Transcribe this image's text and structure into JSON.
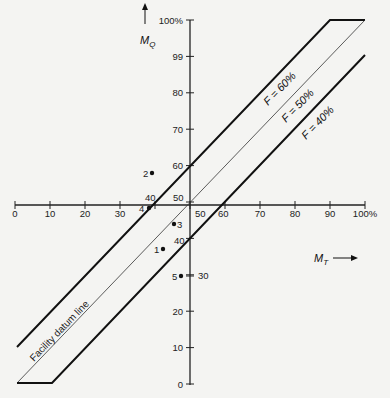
{
  "chart_data": {
    "type": "line",
    "title": "",
    "xlabel": "M_T",
    "ylabel": "M_Q",
    "x_ticks": [
      "0",
      "10",
      "20",
      "30",
      "40",
      "50",
      "60",
      "70",
      "80",
      "90",
      "100%"
    ],
    "y_ticks": [
      "0",
      "10",
      "20",
      "30",
      "40",
      "50",
      "60",
      "70",
      "80",
      "99",
      "100%"
    ],
    "xlim": [
      0,
      100
    ],
    "ylim": [
      0,
      100
    ],
    "grid": false,
    "axis_crossing": {
      "x": 50,
      "y": 50
    },
    "series": [
      {
        "name": "F = 60%",
        "points": [
          [
            0,
            10
          ],
          [
            90,
            100
          ],
          [
            100,
            100
          ]
        ]
      },
      {
        "name": "F = 50%",
        "label": "Facility datum line",
        "points": [
          [
            0,
            0
          ],
          [
            100,
            100
          ]
        ]
      },
      {
        "name": "F = 40%",
        "points": [
          [
            0,
            0
          ],
          [
            10,
            0
          ],
          [
            100,
            90
          ]
        ]
      }
    ],
    "points": [
      {
        "label": "1",
        "x": 42,
        "y": 37
      },
      {
        "label": "2",
        "x": 39,
        "y": 59
      },
      {
        "label": "3",
        "x": 45,
        "y": 45
      },
      {
        "label": "4",
        "x": 38,
        "y": 49
      },
      {
        "label": "5",
        "x": 47,
        "y": 30
      }
    ],
    "annotations": [
      "F = 60%",
      "F = 50%",
      "F = 40%",
      "Facility datum line",
      "40",
      "50",
      "60",
      "40",
      "30"
    ]
  },
  "labels": {
    "x_axis": "M",
    "x_axis_sub": "T",
    "y_axis": "M",
    "y_axis_sub": "Q",
    "f60": "F = 60%",
    "f50": "F = 50%",
    "f40": "F = 40%",
    "datum": "Facility datum line",
    "int_40_top": "40",
    "int_50_center": "50",
    "int_50_right": "50",
    "int_60_right": "60",
    "int_40_below": "40",
    "int_30_below": "30"
  }
}
